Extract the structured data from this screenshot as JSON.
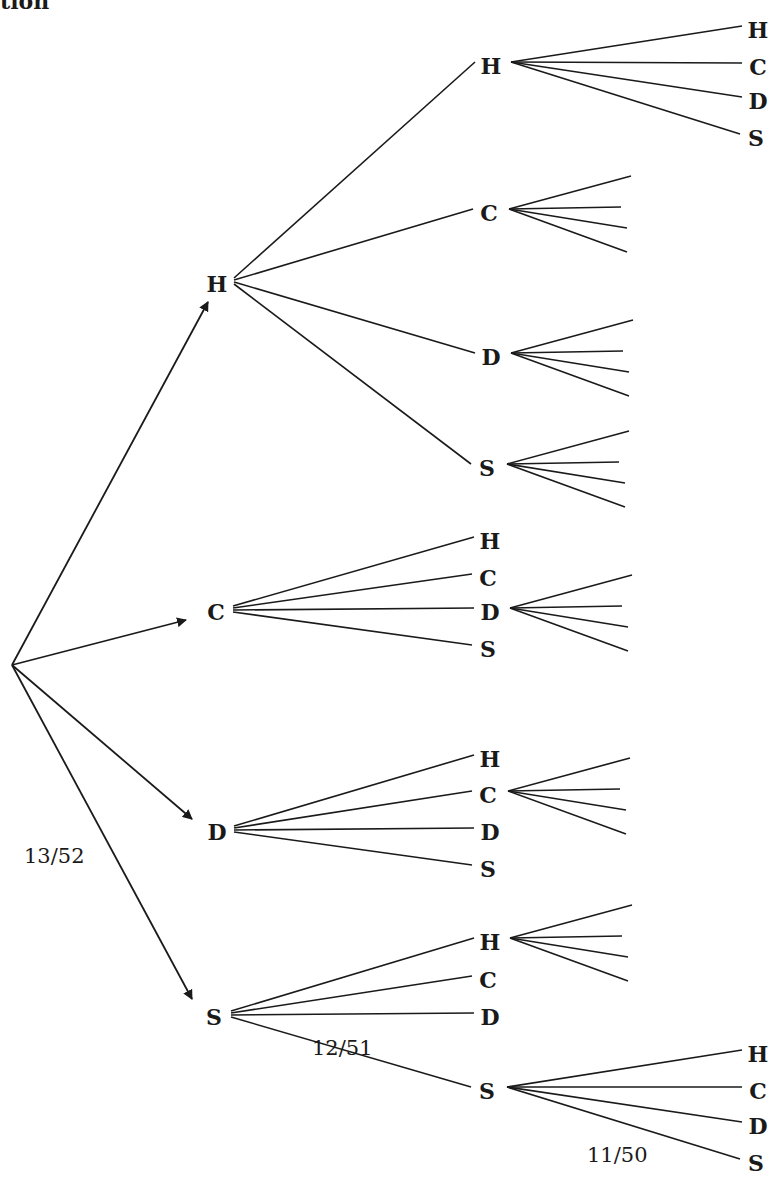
{
  "header": {
    "partial_title": "tion"
  },
  "diagram": {
    "type": "probability-tree",
    "levels": 3,
    "root": {
      "x": 12,
      "y": 665
    },
    "level1": [
      {
        "label": "H",
        "x": 217,
        "y": 284
      },
      {
        "label": "C",
        "x": 216,
        "y": 612
      },
      {
        "label": "D",
        "x": 217,
        "y": 832
      },
      {
        "label": "S",
        "x": 214,
        "y": 1017
      }
    ],
    "level2": [
      {
        "parent": 0,
        "nodes": [
          {
            "label": "H",
            "x": 491,
            "y": 66,
            "expanded": true
          },
          {
            "label": "C",
            "x": 489,
            "y": 213,
            "expanded": true
          },
          {
            "label": "D",
            "x": 491,
            "y": 357,
            "expanded": true
          },
          {
            "label": "S",
            "x": 487,
            "y": 468,
            "expanded": true
          }
        ]
      },
      {
        "parent": 1,
        "nodes": [
          {
            "label": "H",
            "x": 490,
            "y": 541,
            "expanded": false
          },
          {
            "label": "C",
            "x": 488,
            "y": 578,
            "expanded": false
          },
          {
            "label": "D",
            "x": 490,
            "y": 612,
            "expanded": true
          },
          {
            "label": "S",
            "x": 488,
            "y": 649,
            "expanded": false
          }
        ]
      },
      {
        "parent": 2,
        "nodes": [
          {
            "label": "H",
            "x": 490,
            "y": 759,
            "expanded": false
          },
          {
            "label": "C",
            "x": 488,
            "y": 795,
            "expanded": true
          },
          {
            "label": "D",
            "x": 490,
            "y": 832,
            "expanded": false
          },
          {
            "label": "S",
            "x": 488,
            "y": 869,
            "expanded": false
          }
        ]
      },
      {
        "parent": 3,
        "nodes": [
          {
            "label": "H",
            "x": 490,
            "y": 942,
            "expanded": true
          },
          {
            "label": "C",
            "x": 488,
            "y": 980,
            "expanded": false
          },
          {
            "label": "D",
            "x": 490,
            "y": 1017,
            "expanded": false
          },
          {
            "label": "S",
            "x": 487,
            "y": 1091,
            "expanded": true
          }
        ]
      }
    ],
    "level3_labeled": [
      {
        "from": "H-H",
        "labels": [
          {
            "label": "H",
            "x": 758,
            "y": 30
          },
          {
            "label": "C",
            "x": 758,
            "y": 67
          },
          {
            "label": "D",
            "x": 758,
            "y": 101
          },
          {
            "label": "S",
            "x": 756,
            "y": 138
          }
        ]
      },
      {
        "from": "S-S",
        "labels": [
          {
            "label": "H",
            "x": 758,
            "y": 1054
          },
          {
            "label": "C",
            "x": 758,
            "y": 1091
          },
          {
            "label": "D",
            "x": 758,
            "y": 1126
          },
          {
            "label": "S",
            "x": 756,
            "y": 1163
          }
        ]
      }
    ],
    "probabilities": [
      {
        "text": "13/52",
        "x": 24,
        "y": 856
      },
      {
        "text": "12/51",
        "x": 312,
        "y": 1048
      },
      {
        "text": "11/50",
        "x": 587,
        "y": 1155
      }
    ]
  }
}
